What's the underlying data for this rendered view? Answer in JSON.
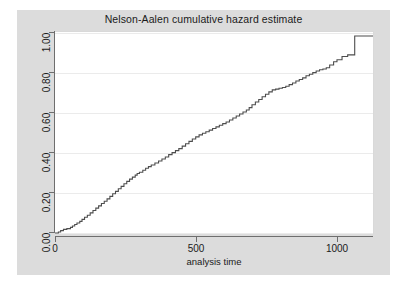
{
  "chart_data": {
    "type": "line",
    "title": "Nelson-Aalen cumulative hazard estimate",
    "subtitle": "",
    "xlabel": "analysis time",
    "ylabel": "",
    "xlim": [
      0,
      1130
    ],
    "ylim": [
      0,
      1.0
    ],
    "grid": true,
    "grid_axis": "y",
    "legend": "none",
    "step_style": "post",
    "line_color": "#4d4d4d",
    "plot_background": "#ffffff",
    "canvas_background": "#dcdcdc",
    "xticks": [
      0,
      500,
      1000
    ],
    "xticklabels": [
      "0",
      "500",
      "1000"
    ],
    "yticks": [
      0.0,
      0.2,
      0.4,
      0.6,
      0.8,
      1.0
    ],
    "yticklabels": [
      "0.00",
      "0.20",
      "0.40",
      "0.60",
      "0.80",
      "1.00"
    ],
    "series": [
      {
        "name": "Nelson-Aalen cumulative hazard",
        "x": [
          0,
          12,
          20,
          30,
          42,
          55,
          62,
          70,
          78,
          88,
          96,
          105,
          115,
          125,
          135,
          145,
          155,
          165,
          175,
          185,
          195,
          205,
          215,
          225,
          235,
          245,
          255,
          265,
          275,
          285,
          292,
          300,
          312,
          322,
          332,
          342,
          355,
          368,
          380,
          392,
          404,
          416,
          428,
          440,
          452,
          464,
          476,
          488,
          500,
          512,
          524,
          536,
          548,
          560,
          572,
          584,
          596,
          608,
          620,
          632,
          644,
          656,
          668,
          680,
          690,
          700,
          712,
          724,
          736,
          748,
          760,
          772,
          784,
          796,
          808,
          820,
          832,
          844,
          856,
          868,
          880,
          892,
          904,
          916,
          928,
          940,
          952,
          964,
          976,
          990,
          1002,
          1020,
          1040,
          1062,
          1065,
          1100,
          1130
        ],
        "y": [
          0.0,
          0.005,
          0.012,
          0.018,
          0.022,
          0.028,
          0.035,
          0.042,
          0.05,
          0.058,
          0.068,
          0.078,
          0.088,
          0.1,
          0.112,
          0.124,
          0.135,
          0.147,
          0.158,
          0.17,
          0.182,
          0.195,
          0.207,
          0.22,
          0.232,
          0.245,
          0.257,
          0.268,
          0.278,
          0.288,
          0.296,
          0.302,
          0.312,
          0.322,
          0.33,
          0.338,
          0.348,
          0.358,
          0.368,
          0.378,
          0.39,
          0.4,
          0.41,
          0.42,
          0.432,
          0.444,
          0.456,
          0.468,
          0.478,
          0.488,
          0.496,
          0.504,
          0.512,
          0.52,
          0.528,
          0.536,
          0.544,
          0.552,
          0.562,
          0.572,
          0.582,
          0.592,
          0.602,
          0.612,
          0.624,
          0.638,
          0.652,
          0.664,
          0.678,
          0.69,
          0.702,
          0.712,
          0.716,
          0.72,
          0.724,
          0.73,
          0.738,
          0.746,
          0.756,
          0.764,
          0.772,
          0.782,
          0.79,
          0.798,
          0.806,
          0.812,
          0.816,
          0.822,
          0.836,
          0.852,
          0.862,
          0.878,
          0.886,
          0.886,
          0.98,
          0.98,
          0.98
        ]
      }
    ]
  },
  "axes": {
    "y_labels": [
      "1.00",
      "0.80",
      "0.60",
      "0.40",
      "0.20",
      "0.00"
    ],
    "x_labels": [
      "0",
      "500",
      "1000"
    ],
    "x_title": "analysis time"
  }
}
